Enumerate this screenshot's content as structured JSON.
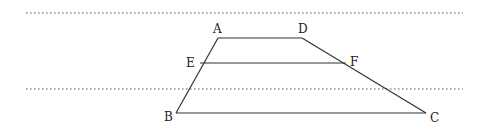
{
  "diagram": {
    "type": "geometry-trapezoid",
    "stroke_color": "#333333",
    "dotted_color": "#555555",
    "dotted_lines": [
      {
        "name": "upper-parallel-line",
        "x1": 26,
        "y1": 13,
        "x2": 463,
        "y2": 13
      },
      {
        "name": "lower-parallel-line",
        "x1": 26,
        "y1": 89,
        "x2": 463,
        "y2": 89
      }
    ],
    "points": {
      "A": {
        "label": "A",
        "x": 218,
        "y": 38,
        "lx": 213,
        "ly": 33
      },
      "D": {
        "label": "D",
        "x": 302,
        "y": 38,
        "lx": 298,
        "ly": 33
      },
      "E": {
        "label": "E",
        "x": 200,
        "y": 63,
        "lx": 186,
        "ly": 67
      },
      "F": {
        "label": "F",
        "x": 346,
        "y": 63,
        "lx": 350,
        "ly": 66
      },
      "B": {
        "label": "B",
        "x": 176,
        "y": 113,
        "lx": 164,
        "ly": 121
      },
      "C": {
        "label": "C",
        "x": 426,
        "y": 113,
        "lx": 430,
        "ly": 122
      }
    },
    "segments": [
      {
        "name": "segment-AD",
        "from": "A",
        "to": "D"
      },
      {
        "name": "segment-AB",
        "from": "A",
        "to": "B"
      },
      {
        "name": "segment-DC",
        "from": "D",
        "to": "C"
      },
      {
        "name": "segment-BC",
        "from": "B",
        "to": "C"
      },
      {
        "name": "segment-EF",
        "from": "E",
        "to": "F"
      }
    ]
  }
}
